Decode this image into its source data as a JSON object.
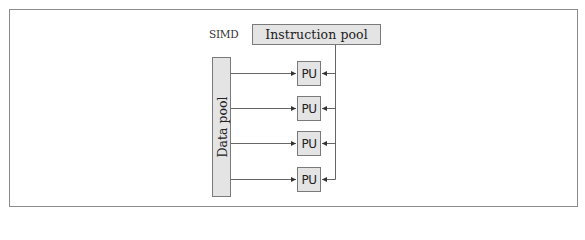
{
  "diagram": {
    "title_label": "SIMD",
    "instruction_pool": {
      "label": "Instruction pool"
    },
    "data_pool": {
      "label": "Data pool"
    },
    "processing_units": [
      {
        "label": "PU"
      },
      {
        "label": "PU"
      },
      {
        "label": "PU"
      },
      {
        "label": "PU"
      }
    ],
    "colors": {
      "box_fill": "#e4e4e4",
      "box_border": "#7a7a7a",
      "line": "#555555",
      "frame_border": "#8a8a8a"
    }
  }
}
